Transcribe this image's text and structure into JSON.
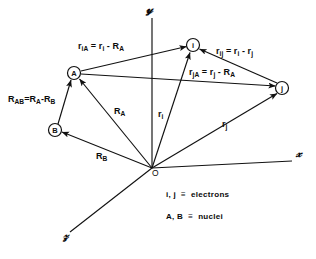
{
  "figure": {
    "background_color": "#ffffff",
    "ink_color": "#111111",
    "width": 316,
    "height": 259
  },
  "axes": {
    "y": {
      "label": "y",
      "name": "y-axis",
      "x": 146,
      "y": 6
    },
    "x": {
      "label": "x",
      "name": "x-axis",
      "x": 296,
      "y": 152
    },
    "z": {
      "label": "z",
      "name": "z-axis",
      "x": 66,
      "y": 236
    }
  },
  "origin": {
    "label": "O",
    "x": 152,
    "y": 168
  },
  "nodes": [
    {
      "id": "A",
      "label": "A",
      "cx": 74,
      "cy": 73,
      "r": 6.5,
      "kind": "nucleus"
    },
    {
      "id": "B",
      "label": "B",
      "cx": 55,
      "cy": 130,
      "r": 6.5,
      "kind": "nucleus"
    },
    {
      "id": "i",
      "label": "i",
      "cx": 193,
      "cy": 45,
      "r": 6.5,
      "kind": "electron"
    },
    {
      "id": "j",
      "label": "j",
      "cx": 282,
      "cy": 88,
      "r": 6.5,
      "kind": "electron"
    }
  ],
  "vectors": [
    {
      "name": "r-iA",
      "from": "A",
      "to": "i",
      "label_html": "r<sub>iA</sub> = r<sub>i</sub> - R<sub>A</sub>",
      "label_text": "r_iA = r_i - R_A",
      "label_x": 78,
      "label_y": 42
    },
    {
      "name": "r-ij",
      "from": "j",
      "to": "i",
      "label_html": "r<sub>ij</sub> = r<sub>i</sub> - r<sub>j</sub>",
      "label_text": "r_ij = r_i - r_j",
      "label_x": 216,
      "label_y": 47
    },
    {
      "name": "r-jA",
      "from": "A",
      "to": "j",
      "label_html": "r<sub>jA</sub> = r<sub>j</sub> - R<sub>A</sub>",
      "label_text": "r_jA = r_j - R_A",
      "label_x": 189,
      "label_y": 68
    },
    {
      "name": "R-AB",
      "from": "B",
      "to": "A",
      "label_html": "R<sub>AB</sub> = R<sub>A</sub> - R<sub>B</sub>",
      "label_text": "R_AB = R_A - R_B",
      "label_x": 8,
      "label_y": 95
    },
    {
      "name": "R-A",
      "from": "O",
      "to": "A",
      "label_html": "R<sub>A</sub>",
      "label_text": "R_A",
      "label_x": 114,
      "label_y": 107
    },
    {
      "name": "R-B",
      "from": "O",
      "to": "B",
      "label_html": "R<sub>B</sub>",
      "label_text": "R_B",
      "label_x": 96,
      "label_y": 152
    },
    {
      "name": "r-i",
      "from": "O",
      "to": "i",
      "label_html": "r<sub>i</sub>",
      "label_text": "r_i",
      "label_x": 158,
      "label_y": 110
    },
    {
      "name": "r-j",
      "from": "O",
      "to": "j",
      "label_html": "r<sub>j</sub>",
      "label_text": "r_j",
      "label_x": 222,
      "label_y": 120
    }
  ],
  "legend": {
    "rows": [
      {
        "name": "legend-electrons",
        "symbols": "i, j",
        "relation": "≡",
        "meaning": "electrons",
        "x": 166,
        "y": 190
      },
      {
        "name": "legend-nuclei",
        "symbols": "A, B",
        "relation": "≡",
        "meaning": "nuclei",
        "x": 166,
        "y": 212
      }
    ]
  }
}
